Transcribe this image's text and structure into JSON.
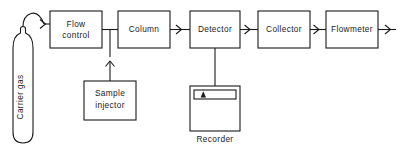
{
  "diagram": {
    "stroke_color": "#1a1a1a",
    "background_color": "#ffffff",
    "source": {
      "name": "carrier-gas-cylinder",
      "label": "Carrier gas",
      "orientation": "vertical"
    },
    "blocks": [
      {
        "id": "flow-control",
        "label_line1": "Flow",
        "label_line2": "control"
      },
      {
        "id": "column",
        "label_line1": "Column",
        "label_line2": ""
      },
      {
        "id": "detector",
        "label_line1": "Detector",
        "label_line2": ""
      },
      {
        "id": "collector",
        "label_line1": "Collector",
        "label_line2": ""
      },
      {
        "id": "flowmeter",
        "label_line1": "Flowmeter",
        "label_line2": ""
      },
      {
        "id": "sample-injector",
        "label_line1": "Sample",
        "label_line2": "injector"
      }
    ],
    "recorder": {
      "id": "recorder",
      "label": "Recorder",
      "label_position": "below",
      "chart_strip": "strip-chart",
      "pen_marker": "pen-trace-marker"
    },
    "flow_path": [
      "Carrier gas",
      "Flow control",
      "Column",
      "Detector",
      "Collector",
      "Flowmeter",
      "vent"
    ],
    "branches": [
      {
        "from": "Sample injector",
        "to": "carrier line between Flow control and Column",
        "direction": "up"
      },
      {
        "from": "Detector",
        "to": "Recorder",
        "direction": "down"
      }
    ]
  }
}
